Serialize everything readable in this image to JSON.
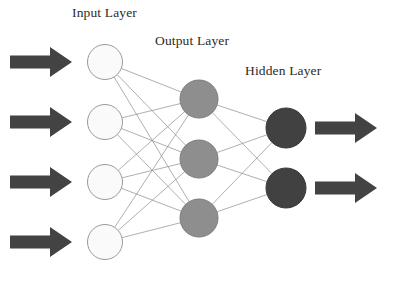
{
  "diagram": {
    "background_color": "#ffffff",
    "width": 397,
    "height": 288
  },
  "labels": {
    "input": "Input Layer",
    "output": "Output Layer",
    "hidden": "Hidden Layer"
  },
  "colors": {
    "input_node_fill": "#fafafa",
    "input_node_stroke": "#9a9a9a",
    "middle_node_fill": "#8e8e8e",
    "middle_node_stroke": "#7c7c7c",
    "dark_node_fill": "#414141",
    "dark_node_stroke": "#3a3a3a",
    "edge_stroke": "#8c8c8c",
    "arrow_fill": "#434343",
    "label_text": "#2b2b2b"
  },
  "chart_data": {
    "type": "diagram",
    "subtype": "feedforward-neural-network",
    "layers": [
      {
        "id": "input",
        "label": "Input Layer",
        "node_count": 4,
        "fill": "#fafafa",
        "stroke": "#9a9a9a",
        "radius": 17.5,
        "nodes": [
          {
            "id": "i1",
            "cx": 105,
            "cy": 62
          },
          {
            "id": "i2",
            "cx": 105,
            "cy": 122
          },
          {
            "id": "i3",
            "cx": 105,
            "cy": 182
          },
          {
            "id": "i4",
            "cx": 105,
            "cy": 242
          }
        ]
      },
      {
        "id": "output",
        "label": "Output Layer",
        "node_count": 3,
        "fill": "#8e8e8e",
        "stroke": "#7c7c7c",
        "radius": 19,
        "nodes": [
          {
            "id": "m1",
            "cx": 199,
            "cy": 99
          },
          {
            "id": "m2",
            "cx": 199,
            "cy": 159
          },
          {
            "id": "m3",
            "cx": 199,
            "cy": 218
          }
        ]
      },
      {
        "id": "hidden",
        "label": "Hidden Layer",
        "node_count": 2,
        "fill": "#414141",
        "stroke": "#3a3a3a",
        "radius": 20,
        "nodes": [
          {
            "id": "h1",
            "cx": 286,
            "cy": 128
          },
          {
            "id": "h2",
            "cx": 286,
            "cy": 188
          }
        ]
      }
    ],
    "connections": {
      "fully_connected": true,
      "stroke": "#8c8c8c",
      "stroke_width": 0.7,
      "edge_count": 18,
      "groups": [
        {
          "from_layer": "input",
          "to_layer": "output",
          "count": 12
        },
        {
          "from_layer": "output",
          "to_layer": "hidden",
          "count": 6
        }
      ]
    },
    "arrows": {
      "fill": "#434343",
      "input_arrows": [
        {
          "id": "in-arrow-1",
          "x": 10,
          "y": 62,
          "direction": "right"
        },
        {
          "id": "in-arrow-2",
          "x": 10,
          "y": 122,
          "direction": "right"
        },
        {
          "id": "in-arrow-3",
          "x": 10,
          "y": 182,
          "direction": "right"
        },
        {
          "id": "in-arrow-4",
          "x": 10,
          "y": 242,
          "direction": "right"
        }
      ],
      "output_arrows": [
        {
          "id": "out-arrow-1",
          "x": 315,
          "y": 128,
          "direction": "right"
        },
        {
          "id": "out-arrow-2",
          "x": 315,
          "y": 188,
          "direction": "right"
        }
      ]
    }
  }
}
